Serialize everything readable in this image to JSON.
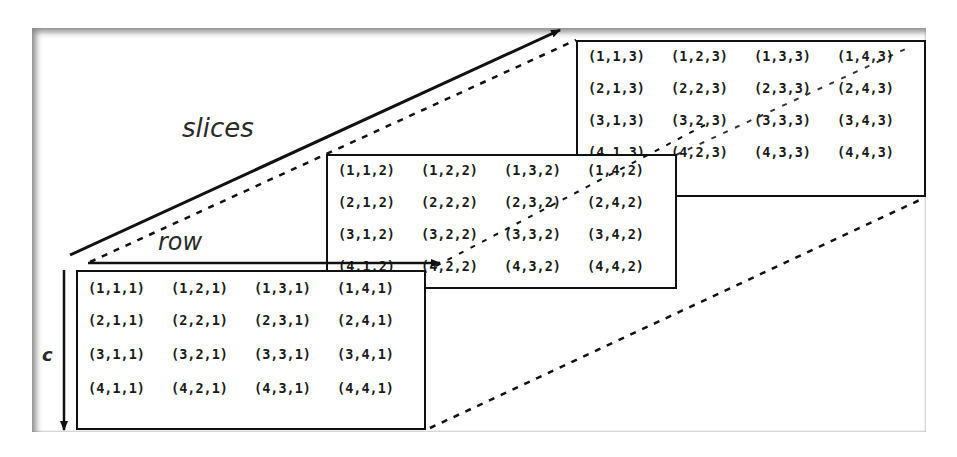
{
  "labels": {
    "slices": "slices",
    "row": "row",
    "column": "c"
  },
  "slices": [
    {
      "index": 1,
      "rows": [
        [
          "(1,1,1)",
          "(1,2,1)",
          "(1,3,1)",
          "(1,4,1)"
        ],
        [
          "(2,1,1)",
          "(2,2,1)",
          "(2,3,1)",
          "(2,4,1)"
        ],
        [
          "(3,1,1)",
          "(3,2,1)",
          "(3,3,1)",
          "(3,4,1)"
        ],
        [
          "(4,1,1)",
          "(4,2,1)",
          "(4,3,1)",
          "(4,4,1)"
        ]
      ]
    },
    {
      "index": 2,
      "rows": [
        [
          "(1,1,2)",
          "(1,2,2)",
          "(1,3,2)",
          "(1,4,2)"
        ],
        [
          "(2,1,2)",
          "(2,2,2)",
          "(2,3,2)",
          "(2,4,2)"
        ],
        [
          "(3,1,2)",
          "(3,2,2)",
          "(3,3,2)",
          "(3,4,2)"
        ],
        [
          "(4,1,2)",
          "(4,2,2)",
          "(4,3,2)",
          "(4,4,2)"
        ]
      ]
    },
    {
      "index": 3,
      "rows": [
        [
          "(1,1,3)",
          "(1,2,3)",
          "(1,3,3)",
          "(1,4,3)"
        ],
        [
          "(2,1,3)",
          "(2,2,3)",
          "(2,3,3)",
          "(2,4,3)"
        ],
        [
          "(3,1,3)",
          "(3,2,3)",
          "(3,3,3)",
          "(3,4,3)"
        ],
        [
          "(4,1,3)",
          "(4,2,3)",
          "(4,3,3)",
          "(4,4,3)"
        ]
      ]
    }
  ]
}
